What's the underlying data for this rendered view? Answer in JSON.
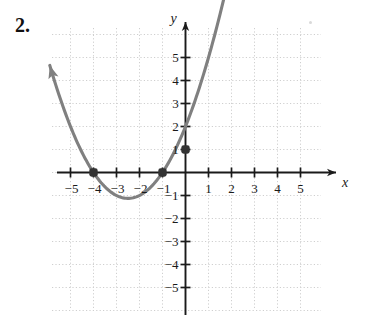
{
  "problem": {
    "number": "2."
  },
  "chart_data": {
    "type": "line",
    "title": "",
    "xlabel": "x",
    "ylabel": "y",
    "xlim": [
      -6,
      6
    ],
    "ylim": [
      -6,
      6
    ],
    "grid": true,
    "grid_style": "dotted",
    "legend": "none",
    "x_ticks": [
      -5,
      -4,
      -3,
      -2,
      -1,
      1,
      2,
      3,
      4,
      5
    ],
    "y_ticks": [
      5,
      4,
      3,
      2,
      1,
      -1,
      -2,
      -3,
      -4,
      -5
    ],
    "x_tick_labels": [
      "−5",
      "−4",
      "−3",
      "−2",
      "−1",
      "1",
      "2",
      "3",
      "4",
      "5"
    ],
    "y_tick_labels": [
      "5",
      "4",
      "3",
      "2",
      "1",
      "−1",
      "−2",
      "−3",
      "−4",
      "−5"
    ],
    "curve": {
      "kind": "parabola",
      "equation": "y = 0.5(x+4)(x+1)",
      "vertex": [
        -2.5,
        -1.125
      ],
      "x_intercepts": [
        -4,
        -1
      ],
      "y_intercept": 1,
      "color": "#808080",
      "arrow_start": [
        -5.9,
        3.4
      ],
      "arrow_end": [
        4.3,
        5.9
      ],
      "samples_x": [
        -5.9,
        -5.5,
        -5.0,
        -4.5,
        -4.0,
        -3.5,
        -3.0,
        -2.5,
        -2.0,
        -1.5,
        -1.0,
        -0.5,
        0.0,
        0.5,
        1.0,
        1.5,
        2.0,
        2.5,
        3.0,
        3.5,
        4.0,
        4.3
      ],
      "samples_y": [
        3.4,
        3.4,
        2.0,
        1.2,
        0.0,
        -0.6,
        -1.0,
        -1.1,
        -1.0,
        -0.6,
        0.0,
        0.9,
        1.0,
        1.9,
        2.8,
        3.3,
        4.0,
        4.4,
        5.0,
        5.4,
        5.8,
        5.9
      ]
    },
    "points": [
      {
        "label": "(-4, 0)",
        "x": -4,
        "y": 0
      },
      {
        "label": "(-1, 0)",
        "x": -1,
        "y": 0
      },
      {
        "label": "(0, 1)",
        "x": 0,
        "y": 1
      }
    ],
    "colors": {
      "curve": "#808080",
      "axis": "#1a1a1a",
      "grid": "#cfcfcf",
      "point": "#333333"
    }
  }
}
